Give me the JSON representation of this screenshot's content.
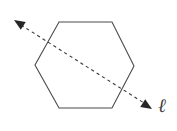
{
  "figure": {
    "background_color": "#ffffff",
    "width": 177,
    "height": 131,
    "labels": {
      "line_label": "ℓ"
    },
    "shapes": {
      "hexagon": {
        "name": "regular-hexagon",
        "stroke_color": "#4a4a4a",
        "stroke_width": 1.1,
        "fill": "none",
        "vertices": [
          [
            59,
            22
          ],
          [
            112,
            22
          ],
          [
            134,
            66
          ],
          [
            112,
            108
          ],
          [
            59,
            108
          ],
          [
            35,
            65
          ]
        ]
      },
      "line": {
        "name": "dashed-symmetry-line",
        "stroke_color": "#3a3a3a",
        "stroke_width": 1.1,
        "dash_pattern": "3.2 3.2",
        "start": [
          20,
          24
        ],
        "end": [
          145,
          104
        ],
        "double_headed": true,
        "arrowheads": [
          {
            "name": "arrowhead-start",
            "tip": [
              14,
              20
            ],
            "color": "#262626",
            "direction": "up-left"
          },
          {
            "name": "arrowhead-end",
            "tip": [
              152,
              109
            ],
            "color": "#262626",
            "direction": "down-right"
          }
        ]
      }
    }
  }
}
